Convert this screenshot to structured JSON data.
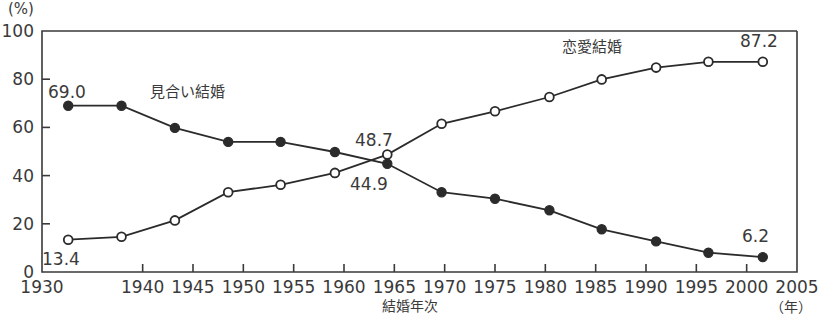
{
  "axes": {
    "y_unit_label": "(%)",
    "y_ticks": [
      "100",
      "80",
      "60",
      "40",
      "20",
      "0"
    ],
    "x_ticks": [
      "1930",
      "1940",
      "1945",
      "1950",
      "1955",
      "1960",
      "1965",
      "1970",
      "1975",
      "1980",
      "1985",
      "1990",
      "1995",
      "2000",
      "2005"
    ],
    "x_axis_title": "結婚年次",
    "x_unit_label": "（年）"
  },
  "series_labels": {
    "arranged": "見合い結婚",
    "love": "恋愛結婚"
  },
  "point_labels": {
    "arranged_first": "69.0",
    "arranged_mid": "44.9",
    "arranged_last": "6.2",
    "love_first": "13.4",
    "love_mid": "48.7",
    "love_last": "87.2"
  },
  "chart_data": {
    "type": "line",
    "title": "",
    "xlabel": "結婚年次",
    "ylabel": "(%)",
    "xlim": [
      1930,
      2005
    ],
    "ylim": [
      0,
      100
    ],
    "grid": false,
    "legend_position": "inline-annotation",
    "x": [
      1932.6,
      1937.9,
      1943.2,
      1948.5,
      1953.7,
      1959.1,
      1964.3,
      1969.7,
      1975.0,
      1980.4,
      1985.6,
      1991.0,
      1996.2,
      2001.6
    ],
    "x_tick_values": [
      1930,
      1940,
      1945,
      1950,
      1955,
      1960,
      1965,
      1970,
      1975,
      1980,
      1985,
      1990,
      1995,
      2000,
      2005
    ],
    "series": [
      {
        "name": "見合い結婚",
        "marker": "filled-circle",
        "color": "#2b2b2b",
        "values": [
          69.0,
          69.0,
          59.8,
          54.0,
          54.0,
          49.8,
          44.9,
          33.1,
          30.4,
          25.6,
          17.7,
          12.7,
          8.0,
          6.2
        ],
        "labeled_points": [
          {
            "x": 1932.6,
            "y": 69.0,
            "label": "69.0"
          },
          {
            "x": 1964.3,
            "y": 44.9,
            "label": "44.9"
          },
          {
            "x": 2001.6,
            "y": 6.2,
            "label": "6.2"
          }
        ]
      },
      {
        "name": "恋愛結婚",
        "marker": "open-circle",
        "color": "#2b2b2b",
        "values": [
          13.4,
          14.6,
          21.4,
          33.1,
          36.2,
          41.1,
          48.7,
          61.5,
          66.7,
          72.6,
          79.9,
          84.8,
          87.2,
          87.2
        ],
        "labeled_points": [
          {
            "x": 1932.6,
            "y": 13.4,
            "label": "13.4"
          },
          {
            "x": 1964.3,
            "y": 48.7,
            "label": "48.7"
          },
          {
            "x": 2001.6,
            "y": 87.2,
            "label": "87.2"
          }
        ]
      }
    ]
  }
}
